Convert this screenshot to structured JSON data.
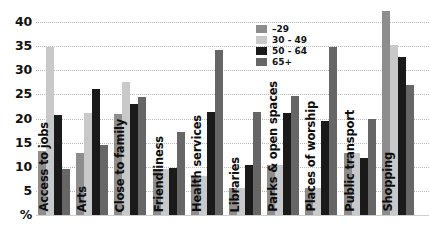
{
  "chart_data": {
    "type": "bar",
    "title": "",
    "xlabel": "",
    "ylabel": "%",
    "ylim": [
      0,
      43
    ],
    "grid": true,
    "legend_position": "top-center-right",
    "ytick_labels": [
      "40",
      "35",
      "30",
      "25",
      "20",
      "15",
      "10",
      "5",
      "%"
    ],
    "yticks": [
      40,
      35,
      30,
      25,
      20,
      15,
      10,
      5,
      0
    ],
    "categories": [
      "Access to jobs",
      "Arts",
      "Close to family",
      "Friendliness",
      "Health services",
      "Libraries",
      "Parks & open spaces",
      "Places of worship",
      "Public transport",
      "Shopping"
    ],
    "series": [
      {
        "name": "–29",
        "color": "#8d8d8d",
        "values": [
          13.2,
          12.8,
          21.0,
          9.5,
          8.1,
          5.5,
          10.4,
          5.6,
          12.9,
          42.3
        ]
      },
      {
        "name": "30 - 49",
        "color": "#c9c9c9",
        "values": [
          34.8,
          21.2,
          27.5,
          9.5,
          8.1,
          5.5,
          10.4,
          5.6,
          12.9,
          35.3
        ]
      },
      {
        "name": "50 - 64",
        "color": "#1a1a1a",
        "values": [
          20.7,
          26.2,
          23.1,
          9.7,
          21.4,
          10.3,
          21.2,
          19.4,
          11.8,
          32.8
        ]
      },
      {
        "name": "65+",
        "color": "#666666",
        "values": [
          9.5,
          14.5,
          24.4,
          17.2,
          34.3,
          21.3,
          24.7,
          34.8,
          20.0,
          27.0
        ]
      }
    ]
  },
  "legend": {
    "items": [
      {
        "label": "–29",
        "color": "#8d8d8d"
      },
      {
        "label": "30 - 49",
        "color": "#c9c9c9"
      },
      {
        "label": "50 - 64",
        "color": "#1a1a1a"
      },
      {
        "label": "65+",
        "color": "#666666"
      }
    ]
  }
}
